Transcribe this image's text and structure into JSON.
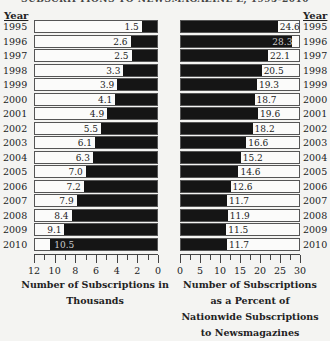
{
  "title": "SUBSCRIPTIONS TO NEWSMAGAZINE Z, 1995-2010",
  "year_header": "Year",
  "chart_data": [
    {
      "type": "bar",
      "orientation": "horizontal",
      "title": "",
      "xlabel": "Number of Subscriptions in Thousands",
      "ylabel": "Year",
      "categories": [
        "1995",
        "1996",
        "1997",
        "1998",
        "1999",
        "2000",
        "2001",
        "2002",
        "2003",
        "2004",
        "2005",
        "2006",
        "2007",
        "2008",
        "2009",
        "2010"
      ],
      "values": [
        1.5,
        2.6,
        2.5,
        3.3,
        3.9,
        4.1,
        4.9,
        5.5,
        6.1,
        6.3,
        7.0,
        7.2,
        7.9,
        8.4,
        9.1,
        10.5
      ],
      "value_labels": [
        "1.5",
        "2.6",
        "2.5",
        "3.3",
        "3.9",
        "4.1",
        "4.9",
        "5.5",
        "6.1",
        "6.3",
        "7.0",
        "7.2",
        "7.9",
        "8.4",
        "9.1",
        "10.5"
      ],
      "xlim": [
        12,
        0
      ],
      "xticks": [
        "12",
        "10",
        "8",
        "6",
        "4",
        "2",
        "0"
      ],
      "direction": "right-to-left"
    },
    {
      "type": "bar",
      "orientation": "horizontal",
      "title": "",
      "xlabel": "Number of Subscriptions as a Percent of Nationwide Subscriptions to Newsmagazines",
      "ylabel": "Year",
      "categories": [
        "1995",
        "1996",
        "1997",
        "1998",
        "1999",
        "2000",
        "2001",
        "2002",
        "2003",
        "2004",
        "2005",
        "2006",
        "2007",
        "2008",
        "2009",
        "2010"
      ],
      "values": [
        24.6,
        28.3,
        22.1,
        20.5,
        19.3,
        18.7,
        19.6,
        18.2,
        16.6,
        15.2,
        14.6,
        12.6,
        11.7,
        11.9,
        11.5,
        11.7
      ],
      "value_labels": [
        "24.6",
        "28.3",
        "22.1",
        "20.5",
        "19.3",
        "18.7",
        "19.6",
        "18.2",
        "16.6",
        "15.2",
        "14.6",
        "12.6",
        "11.7",
        "11.9",
        "11.5",
        "11.7"
      ],
      "xlim": [
        0,
        30
      ],
      "xticks": [
        "0",
        "5",
        "10",
        "15",
        "20",
        "25",
        "30"
      ],
      "direction": "left-to-right"
    }
  ],
  "left_xlabel_lines": [
    "Number of Subscriptions in",
    "Thousands"
  ],
  "right_xlabel_lines": [
    "Number of Subscriptions",
    "as a Percent of",
    "Nationwide Subscriptions",
    "to Newsmagazines"
  ]
}
